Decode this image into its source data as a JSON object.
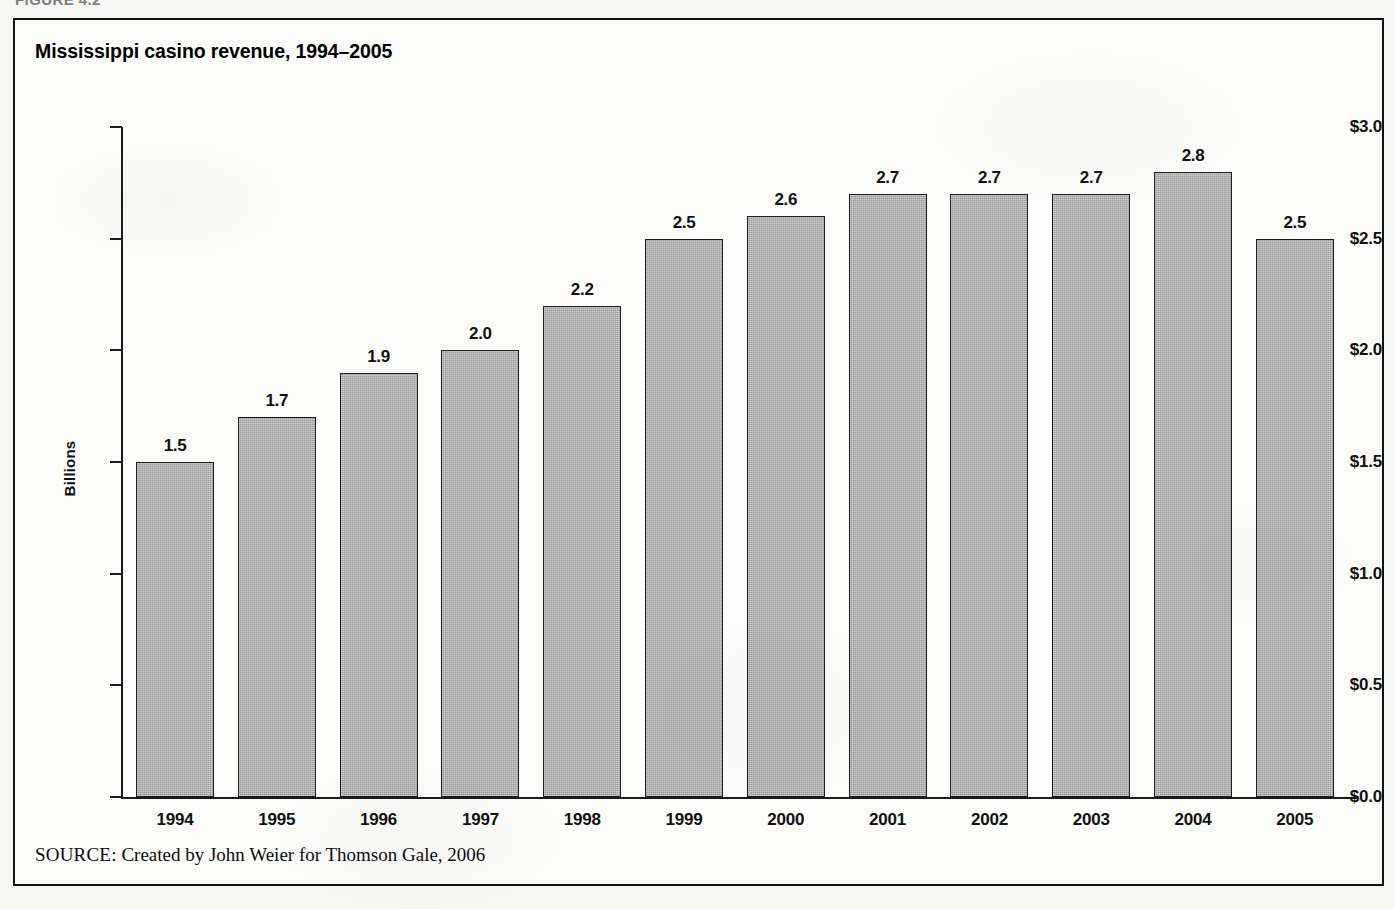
{
  "figure": {
    "caption": "FIGURE 4.2",
    "source_label": "SOURCE:",
    "source_text": " Created by John Weier for Thomson Gale, 2006"
  },
  "colors": {
    "bar_fill": "#9c9c9c",
    "bar_border": "#1c1c1c",
    "axis": "#1b1b1b",
    "text": "#111111",
    "frame": "#111111",
    "panel_background": "#fbfbf9"
  },
  "chart_data": {
    "type": "bar",
    "title": "Mississippi casino revenue, 1994–2005",
    "xlabel": "",
    "ylabel": "Billions",
    "ylim": [
      0.0,
      3.0
    ],
    "ytick_labels": [
      "$3.0",
      "$2.5",
      "$2.0",
      "$1.5",
      "$1.0",
      "$0.5",
      "$0.0"
    ],
    "ytick_values": [
      3.0,
      2.5,
      2.0,
      1.5,
      1.0,
      0.5,
      0.0
    ],
    "grid": false,
    "legend": null,
    "categories": [
      "1994",
      "1995",
      "1996",
      "1997",
      "1998",
      "1999",
      "2000",
      "2001",
      "2002",
      "2003",
      "2004",
      "2005"
    ],
    "values": [
      1.5,
      1.7,
      1.9,
      2.0,
      2.2,
      2.5,
      2.6,
      2.7,
      2.7,
      2.7,
      2.8,
      2.5
    ],
    "value_labels": [
      "1.5",
      "1.7",
      "1.9",
      "2.0",
      "2.2",
      "2.5",
      "2.6",
      "2.7",
      "2.7",
      "2.7",
      "2.8",
      "2.5"
    ]
  }
}
